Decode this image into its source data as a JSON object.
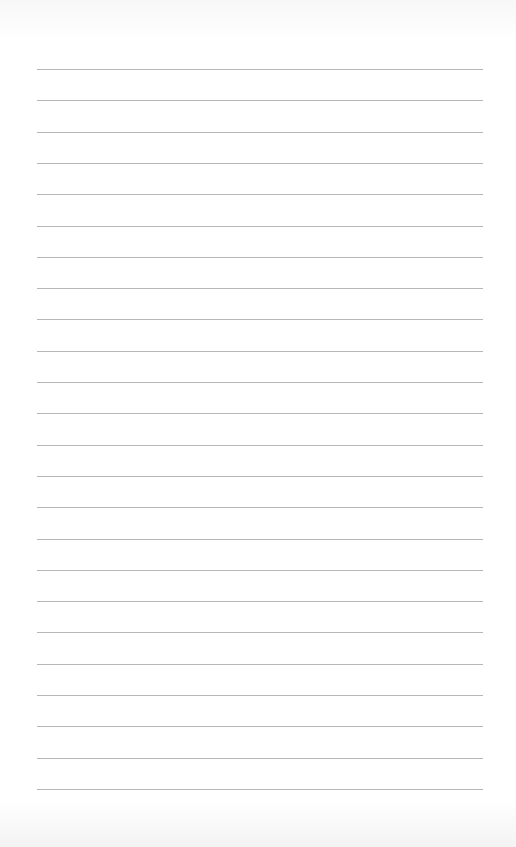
{
  "page": {
    "type": "lined-paper",
    "background_color": "#ffffff",
    "line_color": "#a9a9a9",
    "line_count": 24,
    "first_line_y": 69,
    "line_spacing": 31.3,
    "line_left": 37,
    "line_right": 483
  }
}
